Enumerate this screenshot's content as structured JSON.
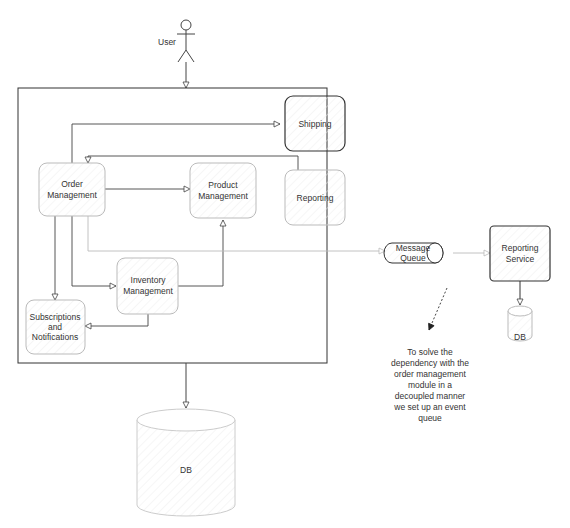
{
  "diagram": {
    "actor": {
      "label": "User"
    },
    "system_nodes": {
      "shipping": "Shipping",
      "reporting": "Reporting",
      "order_management": [
        "Order",
        "Management"
      ],
      "product_management": [
        "Product",
        "Management"
      ],
      "inventory_management": [
        "Inventory",
        "Management"
      ],
      "subscriptions": [
        "Subscriptions",
        "and",
        "Notifications"
      ]
    },
    "main_db": "DB",
    "message_queue": [
      "Message",
      "Queue"
    ],
    "reporting_service": [
      "Reporting",
      "Service"
    ],
    "reporting_db": "DB",
    "note": [
      "To solve the",
      "dependency with the",
      "order management",
      "module in a",
      "decoupled manner",
      "we set up an event",
      "queue"
    ],
    "edges": [
      {
        "from": "User",
        "to": "System"
      },
      {
        "from": "Order Management",
        "to": "Shipping"
      },
      {
        "from": "Reporting",
        "to": "Order Management"
      },
      {
        "from": "Order Management",
        "to": "Product Management"
      },
      {
        "from": "Order Management",
        "to": "Inventory Management"
      },
      {
        "from": "Order Management",
        "to": "Subscriptions and Notifications"
      },
      {
        "from": "Inventory Management",
        "to": "Product Management"
      },
      {
        "from": "Inventory Management",
        "to": "Subscriptions and Notifications"
      },
      {
        "from": "Order Management",
        "to": "Message Queue",
        "style": "light"
      },
      {
        "from": "Message Queue",
        "to": "Reporting Service",
        "style": "light"
      },
      {
        "from": "Reporting Service",
        "to": "DB"
      },
      {
        "from": "System",
        "to": "DB"
      },
      {
        "from": "Note",
        "to": "Message Queue",
        "style": "dashed"
      }
    ]
  }
}
